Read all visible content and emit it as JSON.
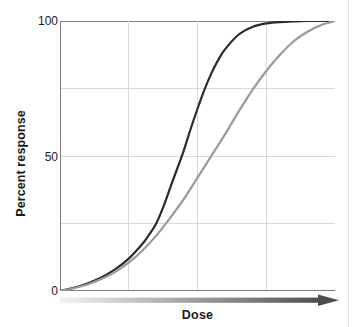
{
  "figure": {
    "background": "#ffffff",
    "page_edge_color": "#e2e2e2"
  },
  "axes": {
    "y_axis_label": "Percent response",
    "x_axis_label": "Dose",
    "y_ticks": [
      "100",
      "50",
      "0"
    ],
    "tick_100": "100",
    "tick_50": "50",
    "tick_0": "0",
    "axis_line_color": "#808080",
    "grid_color": "#d9d9d9"
  },
  "arrow": {
    "name": "dose-gradient-arrow",
    "gradient_from": "#f2f2f2",
    "gradient_to": "#4d4d4d"
  },
  "chart_data": {
    "type": "line",
    "title": "",
    "subtitle": "",
    "xlabel": "Dose",
    "ylabel": "Percent response",
    "xlim": [
      0,
      10
    ],
    "ylim": [
      0,
      100
    ],
    "x_tick_labels": [],
    "y_tick_labels": [
      "0",
      "50",
      "100"
    ],
    "y_ticks_values": [
      0,
      50,
      100
    ],
    "grid": true,
    "grid_horizontal_values": [
      0,
      25,
      50,
      75,
      100
    ],
    "grid_vertical_count": 4,
    "legend": "none",
    "annotations": [],
    "series": [
      {
        "name": "steep-dose-response-curve",
        "color": "#2b2b2b",
        "width": 2.2,
        "note": "sigmoid with lower EC50 and steeper slope",
        "x": [
          0.0,
          0.5,
          1.0,
          1.5,
          2.0,
          2.5,
          3.0,
          3.25,
          3.5,
          3.75,
          4.0,
          4.25,
          4.5,
          4.75,
          5.0,
          5.25,
          5.5,
          5.75,
          6.0,
          6.5,
          7.0,
          7.5,
          8.0,
          9.0,
          10.0
        ],
        "y": [
          0.0,
          1.2,
          2.8,
          5.0,
          8.0,
          12.0,
          17.5,
          21.0,
          25.0,
          31.0,
          38.0,
          45.0,
          52.0,
          60.0,
          67.5,
          74.5,
          80.5,
          85.5,
          89.5,
          95.0,
          97.8,
          99.1,
          99.6,
          100.0,
          100.0
        ]
      },
      {
        "name": "shifted-dose-response-curve",
        "color": "#9a9a9a",
        "width": 2.2,
        "note": "sigmoid shifted right, shallower slope",
        "x": [
          0.0,
          0.5,
          1.0,
          1.5,
          2.0,
          2.5,
          3.0,
          3.5,
          4.0,
          4.5,
          5.0,
          5.5,
          6.0,
          6.5,
          7.0,
          7.5,
          8.0,
          8.5,
          9.0,
          9.5,
          10.0
        ],
        "y": [
          0.0,
          1.0,
          2.4,
          4.4,
          7.0,
          10.5,
          15.0,
          20.5,
          27.0,
          34.0,
          42.0,
          50.0,
          58.0,
          66.5,
          74.5,
          81.5,
          87.5,
          92.5,
          96.0,
          98.5,
          100.0
        ]
      }
    ]
  }
}
